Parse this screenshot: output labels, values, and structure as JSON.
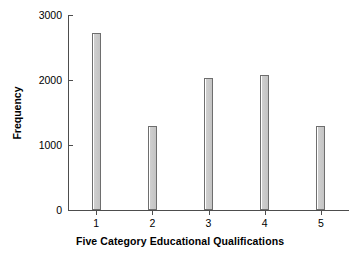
{
  "chart_data": {
    "type": "bar",
    "title": "",
    "subtitle": "",
    "xlabel": "Five Category Educational Qualifications",
    "ylabel": "Frequency",
    "categories": [
      "1",
      "2",
      "3",
      "4",
      "5"
    ],
    "values": [
      2730,
      1300,
      2030,
      2080,
      1290
    ],
    "series": [
      {
        "name": "Frequency",
        "values": [
          2730,
          1300,
          2030,
          2080,
          1290
        ]
      }
    ],
    "xlim": [
      0.5,
      5.5
    ],
    "ylim": [
      0,
      3000
    ],
    "y_ticks": [
      0,
      1000,
      2000,
      3000
    ],
    "y_tick_labels": [
      "0",
      "1000",
      "2000",
      "3000"
    ],
    "x_ticks": [
      1,
      2,
      3,
      4,
      5
    ],
    "x_tick_labels": [
      "1",
      "2",
      "3",
      "4",
      "5"
    ],
    "grid": false,
    "legend": false,
    "legend_position": "none",
    "bar_fill_color": "#c9c9c9",
    "bar_edge_color": "#6e6e6e",
    "axis_color": "#4d4d4d",
    "background_color": "#ffffff",
    "text_color": "#000000"
  },
  "axes": {
    "y_title": "Frequency",
    "x_title": "Five Category Educational Qualifications"
  }
}
